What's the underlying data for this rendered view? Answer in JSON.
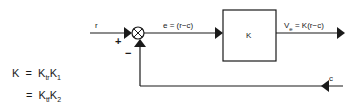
{
  "diagram": {
    "type": "feedback-control-block-diagram",
    "input_label": "r",
    "error_label": "e = (r−c)",
    "block_label": "K",
    "output_label_main": "V",
    "output_label_sub": "e",
    "output_label_rest": " = K(r−c)",
    "feedback_label": "c",
    "plus_sign": "+",
    "minus_sign": "−"
  },
  "equations": {
    "line1": {
      "lhs": "K",
      "eq": "=",
      "t1": "K",
      "t1_sub": "tr",
      "t2": "K",
      "t2_sub": "1"
    },
    "line2": {
      "eq": "=",
      "t1": "K",
      "t1_sub": "tf",
      "t2": "K",
      "t2_sub": "2"
    }
  },
  "colors": {
    "stroke": "#1a1a1a",
    "background": "#ffffff"
  }
}
